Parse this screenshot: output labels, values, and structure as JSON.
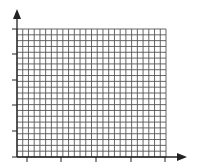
{
  "chart_data": {
    "type": "table",
    "title": "",
    "xlabel": "",
    "ylabel": "",
    "grid": true,
    "grid_columns": 26,
    "grid_rows": 22,
    "x_major_ticks": 5,
    "y_major_ticks": 6,
    "x_tick_labels": [],
    "y_tick_labels": [],
    "series": [],
    "legend": null
  },
  "layout": {
    "plot_left": 17,
    "plot_top": 29,
    "plot_right": 166,
    "plot_bottom": 157,
    "y_arrow_top": 9,
    "x_arrow_right": 187,
    "x_ticks_px": [
      27,
      61,
      96,
      131,
      165
    ],
    "y_ticks_px": [
      29,
      54,
      80,
      105,
      131,
      157
    ]
  },
  "colors": {
    "grid": "#555555",
    "axis": "#222222",
    "background": "#ffffff"
  }
}
